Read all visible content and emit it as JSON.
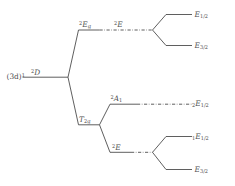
{
  "diagram": {
    "type": "energy-level-splitting-tree",
    "line_color": "#4d4d4d",
    "background_color": "#ffffff",
    "origin": {
      "config_base": "(3d)",
      "config_exponent": "1",
      "term_multiplicity": "2",
      "term_symbol": "D",
      "label_plain": "(3d)1 2D"
    },
    "levels": [
      {
        "id": "eg",
        "multiplicity": "2",
        "symbol": "E",
        "sub": "g",
        "label_plain": "2Eg",
        "stage": "cubic-field",
        "branch": "upper"
      },
      {
        "id": "t2g",
        "multiplicity": "",
        "symbol": "T",
        "sub": "2g",
        "label_plain": "T2g",
        "stage": "cubic-field",
        "branch": "lower"
      },
      {
        "id": "e-upper-double",
        "multiplicity": "2",
        "symbol": "E",
        "sub": "",
        "label_plain": "2E",
        "stage": "double-group",
        "branch": "upper"
      },
      {
        "id": "a1",
        "multiplicity": "2",
        "symbol": "A",
        "sub": "1",
        "label_plain": "2A1",
        "stage": "lower-field",
        "branch": "lower-upper"
      },
      {
        "id": "e-lower-double",
        "multiplicity": "2",
        "symbol": "E",
        "sub": "",
        "label_plain": "2E",
        "stage": "lower-field",
        "branch": "lower-lower"
      }
    ],
    "final_states": [
      {
        "id": "e12-top",
        "prefix": "",
        "symbol": "E",
        "subscript": "1/2",
        "label_plain": "E1/2",
        "order_from_top": 1
      },
      {
        "id": "e32-top",
        "prefix": "",
        "symbol": "E",
        "subscript": "3/2",
        "label_plain": "E3/2",
        "order_from_top": 2
      },
      {
        "id": "e12-2",
        "prefix": "2",
        "symbol": "E",
        "subscript": "1/2",
        "label_plain": "2E1/2",
        "order_from_top": 3
      },
      {
        "id": "e12-1",
        "prefix": "1",
        "symbol": "E",
        "subscript": "1/2",
        "label_plain": "1E1/2",
        "order_from_top": 4
      },
      {
        "id": "e32-bottom",
        "prefix": "",
        "symbol": "E",
        "subscript": "3/2",
        "label_plain": "E3/2",
        "order_from_top": 5
      }
    ]
  }
}
